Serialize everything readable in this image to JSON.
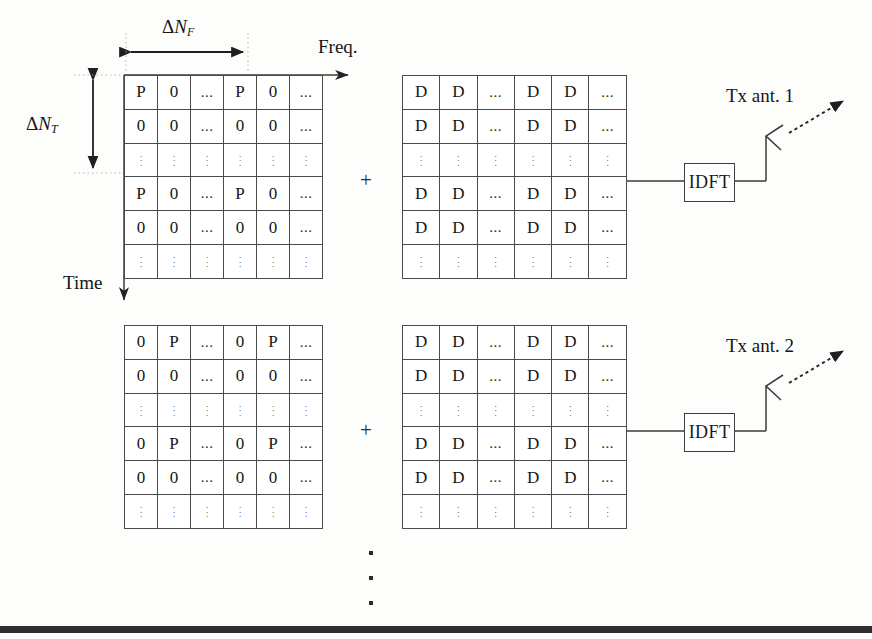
{
  "diagram": {
    "axis_labels": {
      "freq": "Freq.",
      "time": "Time",
      "delta_nf_delta": "Δ",
      "delta_nf_n": "N",
      "delta_nf_sub": "F",
      "delta_nt_delta": "Δ",
      "delta_nt_n": "N",
      "delta_nt_sub": "T"
    },
    "operator": {
      "plus": "+"
    },
    "branches": [
      {
        "id": "branch-1",
        "antenna_label": "Tx ant. 1",
        "idft_label": "IDFT",
        "pilot_grid": {
          "name": "pilot-grid-antenna-1",
          "rows": [
            [
              "P",
              "0",
              "...",
              "P",
              "0",
              "..."
            ],
            [
              "0",
              "0",
              "...",
              "0",
              "0",
              "..."
            ],
            [
              "vdots",
              "vdots",
              "vdots",
              "vdots",
              "vdots",
              "vdots"
            ],
            [
              "P",
              "0",
              "...",
              "P",
              "0",
              "..."
            ],
            [
              "0",
              "0",
              "...",
              "0",
              "0",
              "..."
            ],
            [
              "vdots",
              "vdots",
              "vdots",
              "vdots",
              "vdots",
              "vdots"
            ]
          ]
        },
        "data_grid": {
          "name": "data-grid-antenna-1",
          "rows": [
            [
              "D",
              "D",
              "...",
              "D",
              "D",
              "..."
            ],
            [
              "D",
              "D",
              "...",
              "D",
              "D",
              "..."
            ],
            [
              "vdots",
              "vdots",
              "vdots",
              "vdots",
              "vdots",
              "vdots"
            ],
            [
              "D",
              "D",
              "...",
              "D",
              "D",
              "..."
            ],
            [
              "D",
              "D",
              "...",
              "D",
              "D",
              "..."
            ],
            [
              "vdots",
              "vdots",
              "vdots",
              "vdots",
              "vdots",
              "vdots"
            ]
          ]
        }
      },
      {
        "id": "branch-2",
        "antenna_label": "Tx ant. 2",
        "idft_label": "IDFT",
        "pilot_grid": {
          "name": "pilot-grid-antenna-2",
          "rows": [
            [
              "0",
              "P",
              "...",
              "0",
              "P",
              "..."
            ],
            [
              "0",
              "0",
              "...",
              "0",
              "0",
              "..."
            ],
            [
              "vdots",
              "vdots",
              "vdots",
              "vdots",
              "vdots",
              "vdots"
            ],
            [
              "0",
              "P",
              "...",
              "0",
              "P",
              "..."
            ],
            [
              "0",
              "0",
              "...",
              "0",
              "0",
              "..."
            ],
            [
              "vdots",
              "vdots",
              "vdots",
              "vdots",
              "vdots",
              "vdots"
            ]
          ]
        },
        "data_grid": {
          "name": "data-grid-antenna-2",
          "rows": [
            [
              "D",
              "D",
              "...",
              "D",
              "D",
              "..."
            ],
            [
              "D",
              "D",
              "...",
              "D",
              "D",
              "..."
            ],
            [
              "vdots",
              "vdots",
              "vdots",
              "vdots",
              "vdots",
              "vdots"
            ],
            [
              "D",
              "D",
              "...",
              "D",
              "D",
              "..."
            ],
            [
              "D",
              "D",
              "...",
              "D",
              "D",
              "..."
            ],
            [
              "vdots",
              "vdots",
              "vdots",
              "vdots",
              "vdots",
              "vdots"
            ]
          ]
        }
      }
    ],
    "continuation_marker": "⋮",
    "colors": {
      "ink": "#161616",
      "grid_line": "#4a4a4a",
      "bottom_bar": "#2e2e2e",
      "page": "#fdfdfc"
    }
  }
}
